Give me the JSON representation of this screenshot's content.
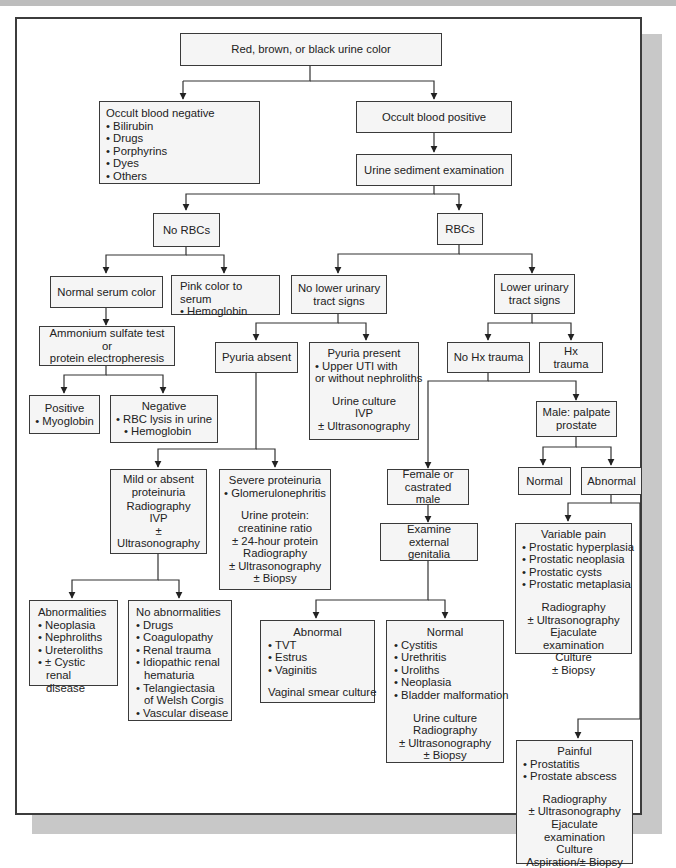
{
  "diagram": {
    "root": "Red, brown, or black urine color",
    "occult_negative": {
      "title": "Occult blood negative",
      "items": [
        "Bilirubin",
        "Drugs",
        "Porphyrins",
        "Dyes",
        "Others"
      ]
    },
    "occult_positive": "Occult blood positive",
    "sediment": "Urine sediment examination",
    "no_rbcs": "No RBCs",
    "rbcs": "RBCs",
    "normal_serum": "Normal serum color",
    "pink_serum": {
      "title": "Pink color to serum",
      "items": [
        "Hemoglobin"
      ]
    },
    "ammonium": {
      "line1": "Ammonium sulfate test or",
      "line2": "protein electropheresis"
    },
    "positive": {
      "title": "Positive",
      "items": [
        "Myoglobin"
      ]
    },
    "negative": {
      "title": "Negative",
      "items": [
        "RBC lysis in urine",
        "Hemoglobin"
      ]
    },
    "no_lower": {
      "line1": "No lower urinary",
      "line2": "tract signs"
    },
    "lower": {
      "line1": "Lower urinary",
      "line2": "tract signs"
    },
    "pyuria_absent": "Pyuria absent",
    "pyuria_present": {
      "title": "Pyuria present",
      "items": [
        "Upper UTI with"
      ],
      "cont": "or without nephroliths",
      "tests": [
        "Urine culture",
        "IVP",
        "± Ultrasonography"
      ]
    },
    "no_hx": "No Hx trauma",
    "hx": "Hx trauma",
    "mild": {
      "line1": "Mild or absent",
      "line2": "proteinuria",
      "tests": [
        "Radiography",
        "IVP",
        "± Ultrasonography"
      ]
    },
    "severe": {
      "title": "Severe proteinuria",
      "items": [
        "Glomerulonephritis"
      ],
      "tests": [
        "Urine protein:",
        "creatinine ratio",
        "± 24-hour protein",
        "Radiography",
        "± Ultrasonography",
        "± Biopsy"
      ]
    },
    "male": {
      "line1": "Male: palpate",
      "line2": "prostate"
    },
    "prostate_normal": "Normal",
    "prostate_abnormal": "Abnormal",
    "female": {
      "line1": "Female or",
      "line2": "castrated male"
    },
    "examine": {
      "line1": "Examine external",
      "line2": "genitalia"
    },
    "variable_pain": {
      "title": "Variable pain",
      "items": [
        "Prostatic hyperplasia",
        "Prostatic neoplasia",
        "Prostatic cysts",
        "Prostatic metaplasia"
      ],
      "tests": [
        "Radiography",
        "± Ultrasonography",
        "Ejaculate examination",
        "Culture",
        "± Biopsy"
      ]
    },
    "abnormalities": {
      "title": "Abnormalities",
      "items": [
        "Neoplasia",
        "Nephroliths",
        "Ureteroliths",
        "± Cystic renal disease"
      ]
    },
    "no_abnormalities": {
      "title": "No abnormalities",
      "items": [
        "Drugs",
        "Coagulopathy",
        "Renal trauma",
        "Idiopathic renal hematuria",
        "Telangiectasia of Welsh Corgis",
        "Vascular disease"
      ]
    },
    "genital_abnormal": {
      "title": "Abnormal",
      "items": [
        "TVT",
        "Estrus",
        "Vaginitis"
      ],
      "tests": [
        "Vaginal smear culture"
      ]
    },
    "genital_normal": {
      "title": "Normal",
      "items": [
        "Cystitis",
        "Urethritis",
        "Uroliths",
        "Neoplasia",
        "Bladder malformation"
      ],
      "tests": [
        "Urine culture",
        "Radiography",
        "± Ultrasonography",
        "± Biopsy"
      ]
    },
    "painful": {
      "title": "Painful",
      "items": [
        "Prostatitis",
        "Prostate abscess"
      ],
      "tests": [
        "Radiography",
        "± Ultrasonography",
        "Ejaculate examination",
        "Culture",
        "Aspiration/± Biopsy"
      ]
    }
  }
}
